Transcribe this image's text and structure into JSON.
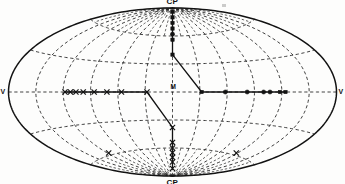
{
  "figure": {
    "projection": "aitoff",
    "background_color": "#fdfdfc",
    "ink_color": "#121212",
    "grid_color": "#1a1a1a",
    "width": 345,
    "height": 184
  },
  "labels": {
    "north_pole": "CP",
    "south_pole": "CP",
    "left_edge": "V",
    "right_edge": "V",
    "center": "M"
  },
  "chart_data": {
    "type": "scatter",
    "title": "",
    "subtitle": "",
    "xlabel": "",
    "ylabel": "",
    "projection": "aitoff",
    "xlim": [
      -180,
      180
    ],
    "ylim": [
      -90,
      90
    ],
    "grid": true,
    "grid_style": "dashed",
    "legend": null,
    "graticule": {
      "meridian_step_deg": 30,
      "parallel_step_deg": 30,
      "meridians_deg": [
        -180,
        -150,
        -120,
        -90,
        -60,
        -30,
        0,
        30,
        60,
        90,
        120,
        150,
        180
      ],
      "parallels_deg": [
        -60,
        -30,
        0,
        30,
        60
      ]
    },
    "annotations": [
      {
        "text": "CP",
        "lon": 0,
        "lat": 90,
        "placement": "above"
      },
      {
        "text": "CP",
        "lon": 0,
        "lat": -90,
        "placement": "below"
      },
      {
        "text": "V",
        "lon": -180,
        "lat": 0,
        "placement": "left"
      },
      {
        "text": "V",
        "lon": 180,
        "lat": 0,
        "placement": "right"
      },
      {
        "text": "M",
        "lon": 0,
        "lat": 0,
        "placement": "above"
      }
    ],
    "series": [
      {
        "name": "north-meridian-track",
        "marker": "square-and-circle",
        "connected": true,
        "points": [
          {
            "lon": 0,
            "lat": 86,
            "marker": "circle"
          },
          {
            "lon": 0,
            "lat": 80,
            "marker": "square"
          },
          {
            "lon": 0,
            "lat": 74,
            "marker": "square"
          },
          {
            "lon": 0,
            "lat": 68,
            "marker": "square"
          },
          {
            "lon": 0,
            "lat": 62,
            "marker": "circle"
          },
          {
            "lon": 0,
            "lat": 56,
            "marker": "square"
          },
          {
            "lon": 0,
            "lat": 40,
            "marker": "square"
          }
        ]
      },
      {
        "name": "equator-east-track",
        "marker": "circle",
        "connected": true,
        "points": [
          {
            "lon": 32,
            "lat": 0,
            "marker": "square"
          },
          {
            "lon": 58,
            "lat": 0,
            "marker": "circle"
          },
          {
            "lon": 82,
            "lat": 0,
            "marker": "circle"
          },
          {
            "lon": 100,
            "lat": 0,
            "marker": "circle"
          },
          {
            "lon": 107,
            "lat": 0,
            "marker": "circle"
          },
          {
            "lon": 118,
            "lat": 0,
            "marker": "square"
          },
          {
            "lon": 124,
            "lat": 0,
            "marker": "square"
          }
        ]
      },
      {
        "name": "equator-west-track",
        "marker": "cross",
        "connected": true,
        "points": [
          {
            "lon": -118,
            "lat": 0,
            "marker": "cross"
          },
          {
            "lon": -112,
            "lat": 0,
            "marker": "cross"
          },
          {
            "lon": -106,
            "lat": 0,
            "marker": "cross"
          },
          {
            "lon": -98,
            "lat": 0,
            "marker": "cross"
          },
          {
            "lon": -86,
            "lat": 0,
            "marker": "cross"
          },
          {
            "lon": -72,
            "lat": 0,
            "marker": "cross"
          },
          {
            "lon": -56,
            "lat": 0,
            "marker": "cross"
          },
          {
            "lon": -28,
            "lat": 0,
            "marker": "cross"
          }
        ]
      },
      {
        "name": "south-meridian-track",
        "marker": "cross",
        "connected": true,
        "points": [
          {
            "lon": 0,
            "lat": -38,
            "marker": "cross"
          },
          {
            "lon": 0,
            "lat": -54,
            "marker": "cross"
          },
          {
            "lon": 0,
            "lat": -60,
            "marker": "cross"
          },
          {
            "lon": 0,
            "lat": -65,
            "marker": "cross"
          },
          {
            "lon": 0,
            "lat": -70,
            "marker": "cross"
          },
          {
            "lon": 0,
            "lat": -75,
            "marker": "cross"
          },
          {
            "lon": 0,
            "lat": -82,
            "marker": "cross"
          }
        ]
      },
      {
        "name": "scattered-crosses",
        "marker": "cross",
        "connected": false,
        "points": [
          {
            "lon": -118,
            "lat": -58,
            "marker": "cross"
          },
          {
            "lon": 118,
            "lat": -58,
            "marker": "cross"
          }
        ]
      }
    ],
    "connectors": [
      {
        "from": {
          "lon": 0,
          "lat": 40
        },
        "to": {
          "lon": 32,
          "lat": 0
        }
      },
      {
        "from": {
          "lon": -28,
          "lat": 0
        },
        "to": {
          "lon": 0,
          "lat": -38
        }
      }
    ]
  }
}
